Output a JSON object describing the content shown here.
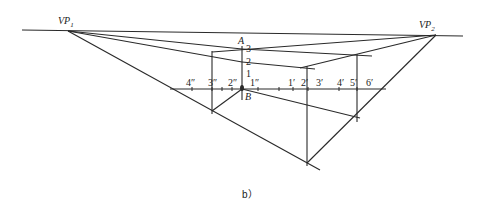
{
  "diagram": {
    "caption": "b）",
    "vanishing_points": {
      "vp1": {
        "label": "VP",
        "sub": "1"
      },
      "vp2": {
        "label": "VP",
        "sub": "2"
      }
    },
    "vertical_labels": {
      "A": "A",
      "B": "B",
      "h3": "3",
      "h2": "2",
      "h1": "1"
    },
    "left_ticks": [
      "4″",
      "3″",
      "2″",
      "1″"
    ],
    "right_ticks": [
      "1′",
      "2′",
      "3′",
      "4′",
      "5′",
      "6′"
    ]
  }
}
